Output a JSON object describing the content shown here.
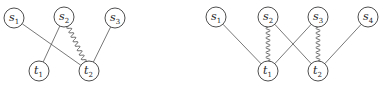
{
  "diagrams": [
    {
      "id": "left",
      "nodes": [
        {
          "id": "s1",
          "base": "s",
          "sub": "1",
          "x": 14,
          "y": 18
        },
        {
          "id": "s2",
          "base": "s",
          "sub": "2",
          "x": 64,
          "y": 17
        },
        {
          "id": "s3",
          "base": "s",
          "sub": "3",
          "x": 115,
          "y": 18
        },
        {
          "id": "t1",
          "base": "t",
          "sub": "1",
          "x": 39,
          "y": 71
        },
        {
          "id": "t2",
          "base": "t",
          "sub": "2",
          "x": 89,
          "y": 71
        }
      ],
      "edges": [
        {
          "from": "s1",
          "to": "t2",
          "style": "straight"
        },
        {
          "from": "s2",
          "to": "t1",
          "style": "straight"
        },
        {
          "from": "s2",
          "to": "t2",
          "style": "wavy"
        },
        {
          "from": "s3",
          "to": "t2",
          "style": "straight"
        }
      ]
    },
    {
      "id": "right",
      "nodes": [
        {
          "id": "s1",
          "base": "s",
          "sub": "1",
          "x": 216,
          "y": 17
        },
        {
          "id": "s2",
          "base": "s",
          "sub": "2",
          "x": 268,
          "y": 17
        },
        {
          "id": "s3",
          "base": "s",
          "sub": "3",
          "x": 318,
          "y": 17
        },
        {
          "id": "s4",
          "base": "s",
          "sub": "4",
          "x": 368,
          "y": 17
        },
        {
          "id": "t1",
          "base": "t",
          "sub": "1",
          "x": 268,
          "y": 71
        },
        {
          "id": "t2",
          "base": "t",
          "sub": "2",
          "x": 318,
          "y": 71
        }
      ],
      "edges": [
        {
          "from": "s1",
          "to": "t1",
          "style": "straight"
        },
        {
          "from": "s2",
          "to": "t1",
          "style": "wavy"
        },
        {
          "from": "s2",
          "to": "t2",
          "style": "straight"
        },
        {
          "from": "s3",
          "to": "t1",
          "style": "straight"
        },
        {
          "from": "s3",
          "to": "t2",
          "style": "wavy"
        },
        {
          "from": "s4",
          "to": "t2",
          "style": "straight"
        }
      ]
    }
  ],
  "style": {
    "node_radius": 10,
    "stroke": "#3a3a3a",
    "background": "#ffffff"
  }
}
